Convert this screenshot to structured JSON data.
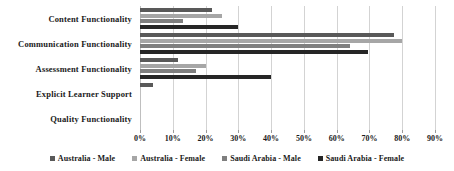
{
  "chart_data": {
    "type": "bar",
    "orientation": "horizontal",
    "title": "",
    "xlabel": "",
    "ylabel": "",
    "xlim": [
      0,
      90
    ],
    "xticks": [
      0,
      10,
      20,
      30,
      40,
      50,
      60,
      70,
      80,
      90
    ],
    "xtick_labels": [
      "0%",
      "10%",
      "20%",
      "30%",
      "40%",
      "50%",
      "60%",
      "70%",
      "80%",
      "90%"
    ],
    "grid": true,
    "legend_position": "bottom",
    "categories": [
      "Content Functionality",
      "Communication Functionality",
      "Assessment Functionality",
      "Explicit Learner Support",
      "Quality Functionality"
    ],
    "series": [
      {
        "name": "Australia - Male",
        "color": "#595959",
        "values": [
          22,
          77.5,
          11.5,
          4,
          0
        ]
      },
      {
        "name": "Australia - Female",
        "color": "#a6a6a6",
        "values": [
          25,
          80,
          20,
          0,
          0
        ]
      },
      {
        "name": "Saudi Arabia - Male",
        "color": "#7f7f7f",
        "values": [
          13,
          64,
          17,
          0,
          0
        ]
      },
      {
        "name": "Saudi Arabia - Female",
        "color": "#262626",
        "values": [
          30,
          69.5,
          40,
          0,
          0
        ]
      }
    ]
  },
  "axis": {
    "gridline_color": "#d3d3d3",
    "zero_line_color": "#bfbfbf"
  }
}
